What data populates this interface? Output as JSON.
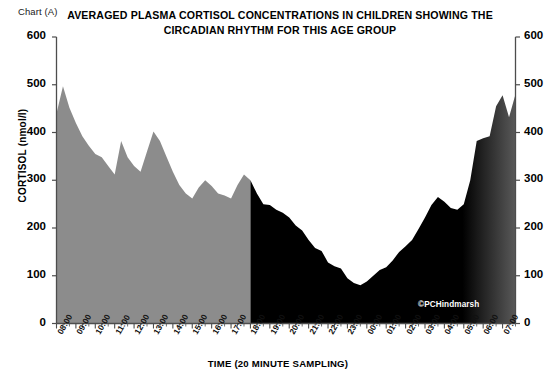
{
  "chart_tag": "Chart (A)",
  "title": {
    "line1": "AVERAGED PLASMA CORTISOL CONCENTRATIONS  IN CHILDREN SHOWING THE",
    "line2": "CIRCADIAN RHYTHM FOR THIS AGE GROUP"
  },
  "watermark": "©PCHindmarsh",
  "colors": {
    "day_fill": "#8c8c8c",
    "night_fill": "#000000",
    "axis": "#4d4d4d",
    "text": "#000000",
    "background": "#ffffff"
  },
  "chart_data": {
    "type": "area",
    "title": "AVERAGED PLASMA CORTISOL CONCENTRATIONS  IN CHILDREN SHOWING THE CIRCADIAN RHYTHM FOR THIS AGE GROUP",
    "xlabel": "TIME (20 MINUTE SAMPLING)",
    "ylabel": "CORTISOL (nmol/l)",
    "ylim": [
      0,
      600
    ],
    "ytick_labels": [
      "600",
      "500",
      "400",
      "300",
      "200",
      "100",
      "0"
    ],
    "yticks": [
      600,
      500,
      400,
      300,
      200,
      100,
      0
    ],
    "dual_y_axis": true,
    "grid": false,
    "legend": "none",
    "sampling_interval_minutes": 20,
    "xtick_labels": [
      "08:00",
      "09:00",
      "10:00",
      "11:00",
      "12:00",
      "13:00",
      "14:00",
      "15:00",
      "16:00",
      "17:00",
      "18:00",
      "19:00",
      "20:00",
      "21:00",
      "22:00",
      "23:00",
      "00:00",
      "01:00",
      "02:00",
      "03:00",
      "04:00",
      "05:00",
      "06:00",
      "07:00"
    ],
    "day_night_split_label": "18:00",
    "series": [
      {
        "name": "Averaged plasma cortisol",
        "unit": "nmol/l",
        "x": [
          "08:00",
          "08:20",
          "08:40",
          "09:00",
          "09:20",
          "09:40",
          "10:00",
          "10:20",
          "10:40",
          "11:00",
          "11:20",
          "11:40",
          "12:00",
          "12:20",
          "12:40",
          "13:00",
          "13:20",
          "13:40",
          "14:00",
          "14:20",
          "14:40",
          "15:00",
          "15:20",
          "15:40",
          "16:00",
          "16:20",
          "16:40",
          "17:00",
          "17:20",
          "17:40",
          "18:00",
          "18:20",
          "18:40",
          "19:00",
          "19:20",
          "19:40",
          "20:00",
          "20:20",
          "20:40",
          "21:00",
          "21:20",
          "21:40",
          "22:00",
          "22:20",
          "22:40",
          "23:00",
          "23:20",
          "23:40",
          "00:00",
          "00:20",
          "00:40",
          "01:00",
          "01:20",
          "01:40",
          "02:00",
          "02:20",
          "02:40",
          "03:00",
          "03:20",
          "03:40",
          "04:00",
          "04:20",
          "04:40",
          "05:00",
          "05:20",
          "05:40",
          "06:00",
          "06:20",
          "06:40",
          "07:00",
          "07:20",
          "07:40"
        ],
        "values": [
          440,
          497,
          452,
          420,
          392,
          372,
          355,
          348,
          330,
          312,
          382,
          348,
          330,
          318,
          360,
          402,
          382,
          350,
          318,
          290,
          272,
          262,
          285,
          300,
          288,
          272,
          268,
          262,
          290,
          312,
          300,
          272,
          250,
          248,
          238,
          232,
          222,
          205,
          195,
          175,
          158,
          152,
          128,
          120,
          115,
          95,
          85,
          80,
          88,
          100,
          112,
          118,
          132,
          150,
          162,
          175,
          198,
          222,
          248,
          265,
          255,
          242,
          238,
          250,
          300,
          382,
          388,
          392,
          455,
          478,
          432,
          480
        ]
      }
    ],
    "annotations": [
      {
        "text": "©PCHindmarsh",
        "at": "22:30",
        "value": 35
      }
    ]
  },
  "segments": {
    "day": {
      "from": "08:00",
      "to": "18:00",
      "fill": "#8c8c8c"
    },
    "night": {
      "from": "18:00",
      "to": "07:40",
      "fill": "#000000"
    }
  }
}
